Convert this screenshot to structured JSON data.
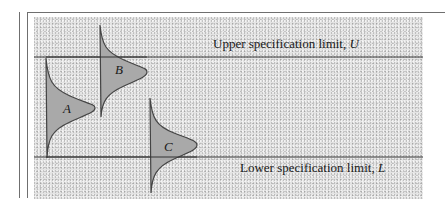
{
  "diagram": {
    "type": "process-distribution-vs-specification-limits",
    "upper_limit": {
      "label": "Upper specification limit,",
      "symbol": "U"
    },
    "lower_limit": {
      "label": "Lower specification limit,",
      "symbol": "L"
    },
    "distributions": [
      {
        "id": "A",
        "label": "A",
        "position": "spans both limits, centered between U and L"
      },
      {
        "id": "B",
        "label": "B",
        "position": "straddles upper limit U"
      },
      {
        "id": "C",
        "label": "C",
        "position": "straddles lower limit L"
      }
    ],
    "colors": {
      "background_stipple": "#e4e4e4",
      "curve_fill": "#a9a9a9",
      "line": "#333333",
      "frame": "#6f6f6f"
    }
  }
}
